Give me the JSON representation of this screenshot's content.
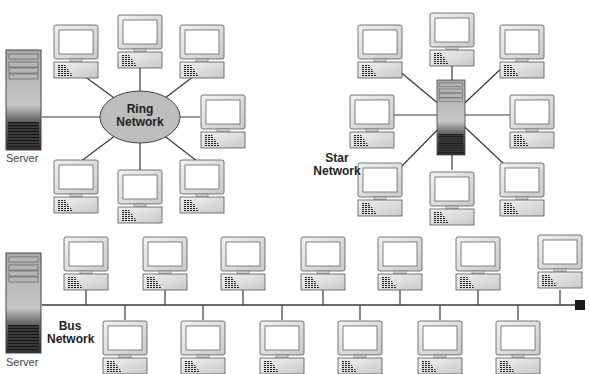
{
  "colors": {
    "line": "#3a3a3a",
    "ring_fill": "#bdbdbd",
    "monitor_fill": "#e8e8e8",
    "screen_fill": "#ffffff",
    "server_top": "#9a9a9a",
    "server_bottom": "#2a2a2a"
  },
  "ring": {
    "label_line1": "Ring",
    "label_line2": "Network",
    "server_label": "Server",
    "center": [
      140,
      117
    ],
    "computers": [
      [
        76,
        25
      ],
      [
        140,
        15
      ],
      [
        202,
        25
      ],
      [
        223,
        95
      ],
      [
        202,
        160
      ],
      [
        140,
        170
      ],
      [
        76,
        160
      ]
    ]
  },
  "star": {
    "label_line1": "Star",
    "label_line2": "Network",
    "center": [
      452,
      115
    ],
    "computers": [
      [
        380,
        25
      ],
      [
        452,
        13
      ],
      [
        522,
        25
      ],
      [
        372,
        95
      ],
      [
        532,
        95
      ],
      [
        380,
        163
      ],
      [
        452,
        172
      ],
      [
        522,
        163
      ]
    ]
  },
  "bus": {
    "label_line1": "Bus",
    "label_line2": "Network",
    "server_label": "Server",
    "line_y": 305,
    "top_computers": [
      86,
      165,
      243,
      323,
      400,
      478,
      560
    ],
    "bottom_computers": [
      125,
      203,
      282,
      360,
      440,
      518
    ]
  }
}
